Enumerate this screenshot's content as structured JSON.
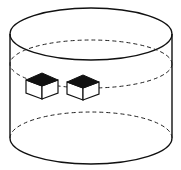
{
  "diagram": {
    "type": "cylinder-with-cubes",
    "cylinder": {
      "cx": 91,
      "top_y": 34,
      "bottom_y": 138,
      "rx": 81,
      "ry": 26,
      "mid_dashed_y": 64,
      "lower_dashed_y": 126
    },
    "cubes": [
      {
        "id": "cube-1",
        "x": 26,
        "y": 72,
        "size": 18
      },
      {
        "id": "cube-2",
        "x": 67,
        "y": 74,
        "size": 18
      }
    ],
    "colors": {
      "stroke": "#111111",
      "cube_top": "#111111",
      "background": "#ffffff"
    }
  }
}
